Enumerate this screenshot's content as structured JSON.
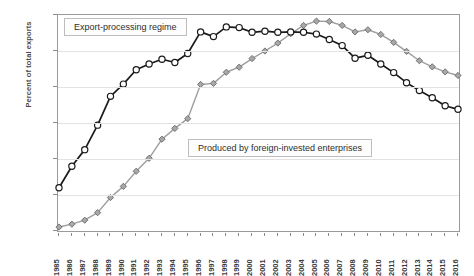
{
  "chart_data": {
    "type": "line",
    "title": "",
    "xlabel": "",
    "ylabel": "Percent of total exports",
    "ylim": [
      0,
      60
    ],
    "ytick_labels": [
      "0%",
      "10%",
      "20%",
      "30%",
      "40%",
      "50%",
      "60%"
    ],
    "ytick_values": [
      0,
      10,
      20,
      30,
      40,
      50,
      60
    ],
    "grid": "horizontal",
    "legend_position": "inline-annotations",
    "categories": [
      "1985",
      "1986",
      "1987",
      "1988",
      "1989",
      "1990",
      "1991",
      "1992",
      "1993",
      "1994",
      "1995",
      "1996",
      "1997",
      "1998",
      "1999",
      "2000",
      "2001",
      "2002",
      "2003",
      "2004",
      "2005",
      "2006",
      "2007",
      "2008",
      "2009",
      "2010",
      "2011",
      "2012",
      "2013",
      "2014",
      "2015",
      "2016"
    ],
    "series": [
      {
        "name": "Export-processing regime",
        "marker": "open-circle",
        "color": "#1a1a1a",
        "values": [
          12.0,
          18.0,
          22.6,
          29.4,
          37.4,
          40.8,
          44.8,
          46.4,
          47.7,
          46.8,
          49.3,
          55.3,
          54.0,
          56.7,
          56.5,
          55.2,
          55.5,
          55.2,
          55.3,
          55.2,
          54.7,
          53.2,
          51.5,
          48.0,
          48.8,
          46.4,
          44.0,
          41.2,
          39.0,
          37.0,
          34.8,
          33.8
        ]
      },
      {
        "name": "Produced by foreign-invested enterprises",
        "marker": "gray-diamond",
        "color": "#9e9e9e",
        "values": [
          1.1,
          1.9,
          3.0,
          5.1,
          9.3,
          12.4,
          16.6,
          20.2,
          25.5,
          28.5,
          31.2,
          40.7,
          41.0,
          44.1,
          45.5,
          47.9,
          50.0,
          52.2,
          54.8,
          57.1,
          58.3,
          58.2,
          57.1,
          55.3,
          55.9,
          54.6,
          52.4,
          49.9,
          47.3,
          45.6,
          44.2,
          43.2
        ]
      }
    ],
    "annotations": [
      {
        "id": "export-regime-label",
        "text": "Export-processing regime"
      },
      {
        "id": "fie-label",
        "text": "Produced by foreign-invested enterprises"
      }
    ]
  },
  "colors": {
    "series_black": "#1a1a1a",
    "series_gray": "#9e9e9e",
    "grid": "#e2e2e2",
    "frame": "#9a9a9a",
    "text": "#3a3a3a"
  }
}
